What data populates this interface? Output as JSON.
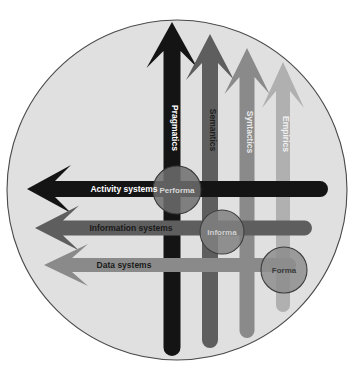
{
  "diagram": {
    "background_color": "#ffffff",
    "disc": {
      "name": "organisational-disc",
      "fill": "#e0e0e0",
      "stroke": "#4a4a4a",
      "cx": 177,
      "cy": 190,
      "r": 170
    },
    "palette": {
      "black": "#141414",
      "dark_gray": "#5e5e5e",
      "mid_gray": "#8a8a8a",
      "light_gray": "#b0b0b0",
      "label_light": "#ffffff",
      "label_dark": "#1a1a1a"
    },
    "vertical_arrows": [
      {
        "id": "pragmatics",
        "label": "Pragmatics",
        "color": "#141414",
        "text_color": "#ffffff",
        "x": 172,
        "top": 22,
        "bottom": 356,
        "width": 17,
        "label_y": 128
      },
      {
        "id": "semantics",
        "label": "Semantics",
        "color": "#5e5e5e",
        "text_color": "#1f1f1f",
        "x": 210,
        "top": 34,
        "bottom": 348,
        "width": 16,
        "label_y": 130
      },
      {
        "id": "syntactics",
        "label": "Syntactics",
        "color": "#8a8a8a",
        "text_color": "#e8e8e8",
        "x": 247,
        "top": 48,
        "bottom": 338,
        "width": 15,
        "label_y": 132
      },
      {
        "id": "empirics",
        "label": "Empirics",
        "color": "#b0b0b0",
        "text_color": "#f0f0f0",
        "x": 283,
        "top": 62,
        "bottom": 312,
        "width": 14,
        "label_y": 134
      }
    ],
    "horizontal_arrows": [
      {
        "id": "activity-systems",
        "label": "Activity systems",
        "color": "#141414",
        "text_color": "#ffffff",
        "y": 189,
        "left": 27,
        "right": 328,
        "height": 16,
        "label_x": 124
      },
      {
        "id": "information-systems",
        "label": "Information systems",
        "color": "#5e5e5e",
        "text_color": "#1a1a1a",
        "y": 228,
        "left": 35,
        "right": 312,
        "height": 15,
        "label_x": 131
      },
      {
        "id": "data-systems",
        "label": "Data systems",
        "color": "#8a8a8a",
        "text_color": "#1a1a1a",
        "y": 265,
        "left": 44,
        "right": 296,
        "height": 14,
        "label_x": 124
      }
    ],
    "nodes": [
      {
        "id": "performa",
        "label": "Performa",
        "cx": 177,
        "cy": 190,
        "r": 24,
        "fill": "#6d6d6d",
        "stroke": "#3a3a3a",
        "text_color": "#d8d8d8"
      },
      {
        "id": "informa",
        "label": "Informa",
        "cx": 222,
        "cy": 232,
        "r": 22,
        "fill": "#808080",
        "stroke": "#3d3d3d",
        "text_color": "#cfcfcf"
      },
      {
        "id": "forma",
        "label": "Forma",
        "cx": 284,
        "cy": 270,
        "r": 23,
        "fill": "#8d8d8d",
        "stroke": "#3d3d3d",
        "text_color": "#3a3a3a"
      }
    ]
  }
}
